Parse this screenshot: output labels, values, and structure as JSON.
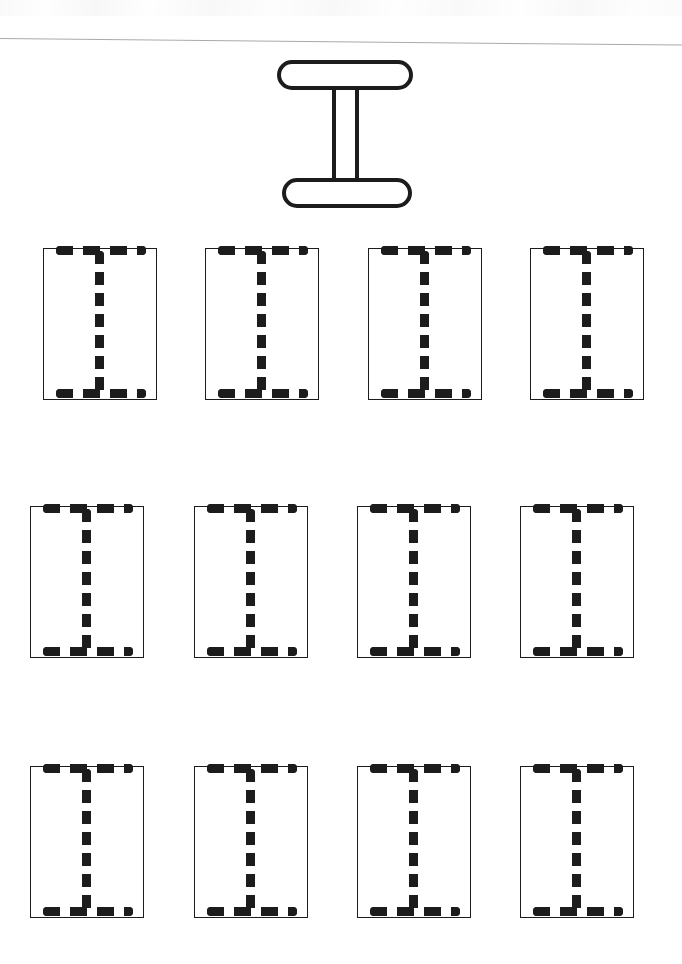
{
  "worksheet": {
    "kind": "letter-tracing-practice-worksheet",
    "letter": "I",
    "letter_case": "uppercase",
    "background_color": "#ffffff",
    "ink_color": "#1c1c1c",
    "rule_color": "#a9aab0",
    "page": {
      "width": 682,
      "height": 964
    }
  },
  "header": {
    "rule": {
      "y": 38,
      "x": 0,
      "width": 682,
      "thickness": 1,
      "tilt_deg": 0.55
    }
  },
  "model_letter": {
    "glyph": "I",
    "style": "outlined-serif-capital",
    "x": 277,
    "y": 60,
    "width": 136,
    "height": 148,
    "stroke_width": 4,
    "parts": [
      {
        "name": "top-serif-bar",
        "shape": "pill",
        "width": 136,
        "height": 30
      },
      {
        "name": "vertical-stem",
        "shape": "rect-outline",
        "width": 27,
        "height": 104
      },
      {
        "name": "bottom-serif-bar",
        "shape": "pill",
        "width": 130,
        "height": 30
      }
    ]
  },
  "practice_grid": {
    "rows": 3,
    "columns": 4,
    "total_boxes": 12,
    "box_width": 114,
    "box_height": 152,
    "border_width": 1.6,
    "guide_style": "dotted",
    "row_tops": [
      248,
      506,
      766
    ],
    "row_lefts": [
      [
        43,
        205,
        368,
        530
      ],
      [
        30,
        194,
        357,
        520
      ],
      [
        30,
        194,
        357,
        520
      ]
    ]
  },
  "trace_guide": {
    "bar_dash_length": 17,
    "bar_dash_gap": 10,
    "bar_thickness": 9,
    "bar_inset_x": 12,
    "bar_width": 90,
    "stem_dash_length": 13,
    "stem_dash_gap": 8,
    "stem_thickness": 9,
    "stem_top_offset": 2,
    "stem_height": 146
  },
  "boxes": [
    {
      "index": 1,
      "row": 1,
      "col": 1,
      "x": 43,
      "y": 248
    },
    {
      "index": 2,
      "row": 1,
      "col": 2,
      "x": 205,
      "y": 248
    },
    {
      "index": 3,
      "row": 1,
      "col": 3,
      "x": 368,
      "y": 248
    },
    {
      "index": 4,
      "row": 1,
      "col": 4,
      "x": 530,
      "y": 248
    },
    {
      "index": 5,
      "row": 2,
      "col": 1,
      "x": 30,
      "y": 506
    },
    {
      "index": 6,
      "row": 2,
      "col": 2,
      "x": 194,
      "y": 506
    },
    {
      "index": 7,
      "row": 2,
      "col": 3,
      "x": 357,
      "y": 506
    },
    {
      "index": 8,
      "row": 2,
      "col": 4,
      "x": 520,
      "y": 506
    },
    {
      "index": 9,
      "row": 3,
      "col": 1,
      "x": 30,
      "y": 766
    },
    {
      "index": 10,
      "row": 3,
      "col": 2,
      "x": 194,
      "y": 766
    },
    {
      "index": 11,
      "row": 3,
      "col": 3,
      "x": 357,
      "y": 766
    },
    {
      "index": 12,
      "row": 3,
      "col": 4,
      "x": 520,
      "y": 766
    }
  ]
}
